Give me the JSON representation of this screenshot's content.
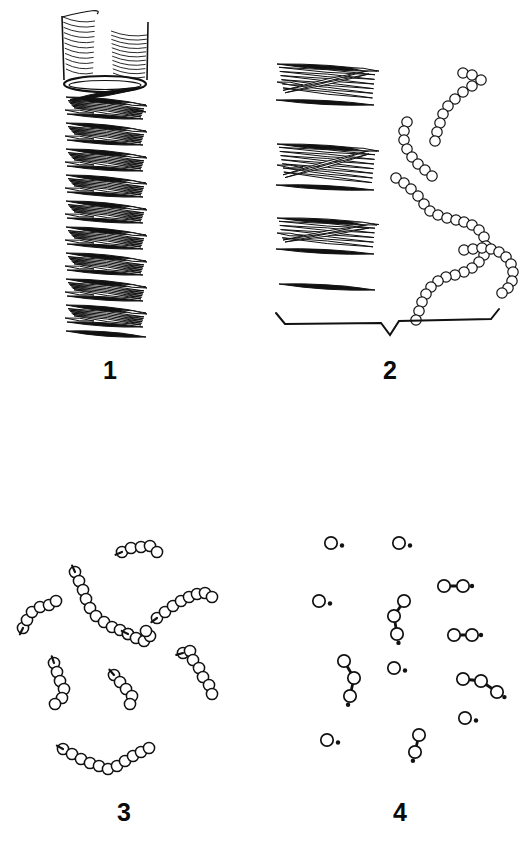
{
  "figure": {
    "background_color": "#ffffff",
    "ink_color": "#111111",
    "width": 529,
    "height": 842,
    "caption_font_weight": "bold"
  },
  "panels": [
    {
      "id": "panel-1",
      "label": "1",
      "label_position": {
        "x": 103,
        "y": 358
      },
      "description": "intact helical cylindrical fibril with open hatched top",
      "content_type": "helical-cylinder"
    },
    {
      "id": "panel-2",
      "label": "2",
      "label_position": {
        "x": 383,
        "y": 358
      },
      "description": "dissociated rod bundles and released bead chains, spanned by a brace",
      "content_type": "rod-bundles-and-bead-chains",
      "has_brace": true
    },
    {
      "id": "panel-3",
      "label": "3",
      "label_position": {
        "x": 117,
        "y": 800
      },
      "description": "short fragmented oligomer bead chains scattered",
      "content_type": "short-bead-chains"
    },
    {
      "id": "panel-4",
      "label": "4",
      "label_position": {
        "x": 393,
        "y": 800
      },
      "description": "monomers with dots, dimers and trimers",
      "content_type": "monomers-and-dimers"
    }
  ],
  "chart_data": {
    "type": "diagram",
    "title": "",
    "panel_1_helix": {
      "cylinder_top": {
        "cx": 105,
        "top_y": 12,
        "rx": 43,
        "ry": 9,
        "wall_bottom_y": 80
      },
      "hatch_lines_left": 11,
      "hatch_lines_right": 11,
      "rim_ellipse": {
        "cx": 105,
        "cy": 84,
        "rx": 41,
        "ry": 8
      },
      "coil_turns": 9,
      "turn_pitch": 26,
      "first_turn_y": 96,
      "rods_per_turn": 6,
      "rod_length": 78,
      "rod_thickness": 5.5,
      "helix_left_x": 64,
      "helix_right_x": 148
    },
    "panel_2_bundles": [
      {
        "y": 64,
        "rods": 6,
        "left_x": 277,
        "right_x": 377,
        "slant": 14
      },
      {
        "y": 144,
        "rods": 7,
        "left_x": 277,
        "right_x": 377,
        "slant": 14
      },
      {
        "y": 218,
        "rods": 5,
        "left_x": 277,
        "right_x": 377,
        "slant": 13
      },
      {
        "y": 284,
        "rods": 1,
        "left_x": 279,
        "right_x": 375,
        "slant": 6
      }
    ],
    "panel_2_chains": [
      {
        "name": "chain-v-top-right",
        "beads": 11,
        "points": [
          [
            463,
            73
          ],
          [
            472,
            75
          ],
          [
            481,
            80
          ],
          [
            472,
            86
          ],
          [
            463,
            92
          ],
          [
            455,
            99
          ],
          [
            448,
            106
          ],
          [
            443,
            114
          ],
          [
            440,
            123
          ],
          [
            437,
            132
          ],
          [
            435,
            141
          ]
        ]
      },
      {
        "name": "chain-short-left",
        "beads": 8,
        "points": [
          [
            407,
            122
          ],
          [
            404,
            131
          ],
          [
            404,
            140
          ],
          [
            407,
            149
          ],
          [
            412,
            157
          ],
          [
            418,
            164
          ],
          [
            425,
            170
          ],
          [
            432,
            176
          ]
        ]
      },
      {
        "name": "chain-long-s",
        "beads": 26,
        "points": [
          [
            396,
            178
          ],
          [
            404,
            183
          ],
          [
            411,
            189
          ],
          [
            418,
            196
          ],
          [
            424,
            204
          ],
          [
            430,
            211
          ],
          [
            438,
            215
          ],
          [
            447,
            218
          ],
          [
            456,
            220
          ],
          [
            464,
            222
          ],
          [
            472,
            225
          ],
          [
            479,
            230
          ],
          [
            484,
            237
          ],
          [
            486,
            246
          ],
          [
            484,
            255
          ],
          [
            479,
            262
          ],
          [
            472,
            268
          ],
          [
            464,
            272
          ],
          [
            455,
            275
          ],
          [
            446,
            277
          ],
          [
            438,
            281
          ],
          [
            431,
            287
          ],
          [
            426,
            294
          ],
          [
            422,
            302
          ],
          [
            419,
            311
          ],
          [
            416,
            320
          ]
        ]
      },
      {
        "name": "chain-short-bottom-right",
        "beads": 11,
        "points": [
          [
            464,
            250
          ],
          [
            473,
            249
          ],
          [
            482,
            248
          ],
          [
            491,
            249
          ],
          [
            499,
            252
          ],
          [
            506,
            257
          ],
          [
            511,
            264
          ],
          [
            513,
            272
          ],
          [
            512,
            281
          ],
          [
            508,
            288
          ],
          [
            502,
            293
          ]
        ]
      }
    ],
    "panel_3_chains": [
      {
        "name": "chain-3-top-center",
        "beads": 5,
        "points": [
          [
            122,
            552
          ],
          [
            131,
            548
          ],
          [
            141,
            547
          ],
          [
            150,
            546
          ],
          [
            157,
            552
          ]
        ]
      },
      {
        "name": "chain-3-upper-left",
        "beads": 6,
        "points": [
          [
            23,
            628
          ],
          [
            27,
            620
          ],
          [
            32,
            612
          ],
          [
            40,
            607
          ],
          [
            49,
            605
          ],
          [
            56,
            601
          ]
        ]
      },
      {
        "name": "chain-3-center-long",
        "beads": 10,
        "points": [
          [
            75,
            572
          ],
          [
            79,
            581
          ],
          [
            83,
            590
          ],
          [
            86,
            599
          ],
          [
            90,
            608
          ],
          [
            96,
            616
          ],
          [
            104,
            622
          ],
          [
            112,
            627
          ],
          [
            120,
            630
          ],
          [
            128,
            634
          ]
        ]
      },
      {
        "name": "chain-3-center-right",
        "beads": 5,
        "points": [
          [
            128,
            634
          ],
          [
            136,
            638
          ],
          [
            144,
            641
          ],
          [
            150,
            636
          ],
          [
            146,
            631
          ]
        ]
      },
      {
        "name": "chain-3-right-upper",
        "beads": 8,
        "points": [
          [
            157,
            618
          ],
          [
            165,
            612
          ],
          [
            173,
            606
          ],
          [
            181,
            601
          ],
          [
            189,
            597
          ],
          [
            197,
            594
          ],
          [
            205,
            593
          ],
          [
            212,
            597
          ]
        ]
      },
      {
        "name": "chain-3-left-lower",
        "beads": 6,
        "points": [
          [
            54,
            663
          ],
          [
            57,
            672
          ],
          [
            60,
            681
          ],
          [
            64,
            689
          ],
          [
            62,
            698
          ],
          [
            55,
            704
          ]
        ]
      },
      {
        "name": "chain-3-mid-lower",
        "beads": 5,
        "points": [
          [
            114,
            675
          ],
          [
            120,
            682
          ],
          [
            126,
            689
          ],
          [
            132,
            696
          ],
          [
            130,
            704
          ]
        ]
      },
      {
        "name": "chain-3-right-lower",
        "beads": 7,
        "points": [
          [
            183,
            653
          ],
          [
            190,
            651
          ],
          [
            193,
            660
          ],
          [
            199,
            668
          ],
          [
            203,
            677
          ],
          [
            209,
            685
          ],
          [
            212,
            694
          ]
        ]
      },
      {
        "name": "chain-3-bottom-arc",
        "beads": 11,
        "points": [
          [
            63,
            749
          ],
          [
            72,
            754
          ],
          [
            81,
            759
          ],
          [
            90,
            763
          ],
          [
            99,
            766
          ],
          [
            108,
            769
          ],
          [
            117,
            766
          ],
          [
            125,
            761
          ],
          [
            133,
            756
          ],
          [
            141,
            752
          ],
          [
            149,
            748
          ]
        ]
      }
    ],
    "panel_4_units": [
      {
        "name": "monomer",
        "beads": 1,
        "points": [
          [
            331,
            543
          ]
        ]
      },
      {
        "name": "monomer",
        "beads": 1,
        "points": [
          [
            399,
            543
          ]
        ]
      },
      {
        "name": "dimer",
        "beads": 2,
        "points": [
          [
            444,
            586
          ],
          [
            463,
            586
          ]
        ]
      },
      {
        "name": "monomer",
        "beads": 1,
        "points": [
          [
            319,
            601
          ]
        ]
      },
      {
        "name": "trimer",
        "beads": 3,
        "points": [
          [
            404,
            601
          ],
          [
            394,
            616
          ],
          [
            397,
            634
          ]
        ]
      },
      {
        "name": "dimer",
        "beads": 2,
        "points": [
          [
            454,
            635
          ],
          [
            472,
            635
          ]
        ]
      },
      {
        "name": "trimer",
        "beads": 3,
        "points": [
          [
            344,
            661
          ],
          [
            354,
            678
          ],
          [
            350,
            696
          ]
        ]
      },
      {
        "name": "monomer",
        "beads": 1,
        "points": [
          [
            394,
            668
          ]
        ]
      },
      {
        "name": "trimer",
        "beads": 3,
        "points": [
          [
            463,
            679
          ],
          [
            481,
            681
          ],
          [
            497,
            692
          ]
        ]
      },
      {
        "name": "monomer",
        "beads": 1,
        "points": [
          [
            465,
            718
          ]
        ]
      },
      {
        "name": "monomer",
        "beads": 1,
        "points": [
          [
            327,
            740
          ]
        ]
      },
      {
        "name": "dimer",
        "beads": 2,
        "points": [
          [
            419,
            735
          ],
          [
            415,
            752
          ]
        ]
      }
    ],
    "panel_2_brace": {
      "left_x": 281,
      "right_x": 497,
      "y": 322,
      "notch_x": 390,
      "notch_depth": 13
    }
  }
}
